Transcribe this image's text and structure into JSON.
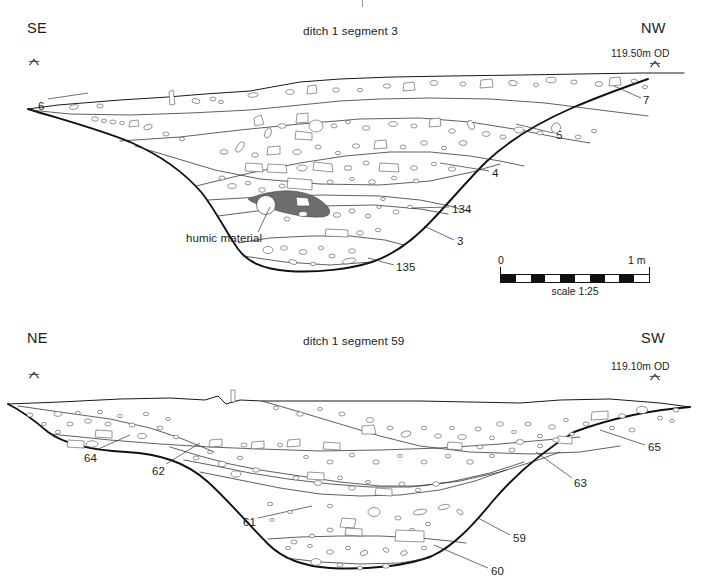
{
  "figure": {
    "background_color": "#ffffff",
    "ink_color": "#1a1a1a",
    "humic_fill_color": "#6d6d6d",
    "type": "archaeological-section-drawing",
    "sections_count": 2
  },
  "section_1": {
    "title": "ditch 1 segment 3",
    "left_orientation": "SE",
    "right_orientation": "NW",
    "datum_level": "119.50m OD",
    "datum_marker_icon": "datum-arrow-icon",
    "annotation": "humic material",
    "context_labels": [
      {
        "text": "6",
        "x": 38,
        "y": 100
      },
      {
        "text": "7",
        "x": 643,
        "y": 94
      },
      {
        "text": "5",
        "x": 556,
        "y": 134
      },
      {
        "text": "4",
        "x": 492,
        "y": 172
      },
      {
        "text": "134",
        "x": 452,
        "y": 209
      },
      {
        "text": "3",
        "x": 457,
        "y": 241
      },
      {
        "text": "135",
        "x": 396,
        "y": 267
      }
    ]
  },
  "section_2": {
    "title": "ditch 1 segment 59",
    "left_orientation": "NE",
    "right_orientation": "SW",
    "datum_level": "119.10m OD",
    "datum_marker_icon": "datum-arrow-icon",
    "context_labels": [
      {
        "text": "64",
        "x": 84,
        "y": 452
      },
      {
        "text": "62",
        "x": 152,
        "y": 469
      },
      {
        "text": "61",
        "x": 243,
        "y": 520
      },
      {
        "text": "65",
        "x": 648,
        "y": 446
      },
      {
        "text": "63",
        "x": 574,
        "y": 482
      },
      {
        "text": "59",
        "x": 513,
        "y": 537
      },
      {
        "text": "60",
        "x": 491,
        "y": 570
      }
    ]
  },
  "scale": {
    "zero_label": "0",
    "one_metre_label": "1 m",
    "caption": "scale 1:25",
    "segments": 10,
    "length_px": 150
  }
}
